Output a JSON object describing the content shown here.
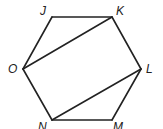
{
  "diagram": {
    "shape": "hexagon",
    "vertices": [
      "J",
      "K",
      "L",
      "M",
      "N",
      "O"
    ],
    "sides": [
      [
        "J",
        "K"
      ],
      [
        "K",
        "L"
      ],
      [
        "L",
        "M"
      ],
      [
        "M",
        "N"
      ],
      [
        "N",
        "O"
      ],
      [
        "O",
        "J"
      ]
    ],
    "diagonals": [
      [
        "O",
        "K"
      ],
      [
        "N",
        "L"
      ]
    ],
    "labels": {
      "J": "J",
      "K": "K",
      "L": "L",
      "M": "M",
      "N": "N",
      "O": "O"
    },
    "colors": {
      "stroke": "#222222",
      "background": "#ffffff"
    }
  }
}
